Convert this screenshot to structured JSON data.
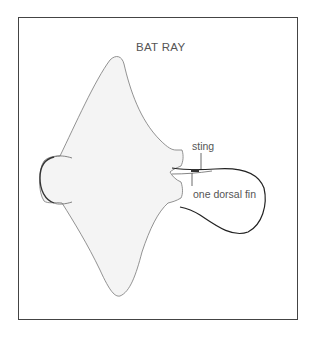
{
  "figure": {
    "title": "BAT RAY",
    "labels": {
      "sting": "sting",
      "dorsal_fin": "one dorsal fin"
    },
    "colors": {
      "outline": "#555555",
      "body_fill": "#f3f3f3",
      "frame": "#444444"
    }
  }
}
